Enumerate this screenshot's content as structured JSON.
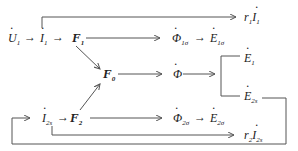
{
  "diagram": {
    "nodes": {
      "U1": {
        "base": "U",
        "sub": "1",
        "dot": true
      },
      "I1": {
        "base": "I",
        "sub": "1",
        "dot": true
      },
      "F1": {
        "base": "F",
        "sub": "1",
        "bold": true
      },
      "F0": {
        "base": "F",
        "sub": "0",
        "bold": true
      },
      "F2": {
        "base": "F",
        "sub": "2",
        "bold": true
      },
      "I2s": {
        "base": "I",
        "sub": "2s",
        "dot": true
      },
      "Phi1s": {
        "base": "Φ",
        "sub": "1σ",
        "dot": true
      },
      "E1s": {
        "base": "E",
        "sub": "1σ",
        "dot": true
      },
      "Phi": {
        "base": "Φ",
        "sub": "",
        "dot": true
      },
      "E1": {
        "base": "E",
        "sub": "1",
        "dot": true
      },
      "E2s": {
        "base": "E",
        "sub": "2s",
        "dot": true
      },
      "Phi2s": {
        "base": "Φ",
        "sub": "2σ",
        "dot": true
      },
      "E2sig": {
        "base": "E",
        "sub": "2σ",
        "dot": true
      },
      "r1I1": {
        "coef": "r",
        "coef_sub": "1",
        "base": "I",
        "sub": "1",
        "dot": true
      },
      "r2I2s": {
        "coef": "r",
        "coef_sub": "2",
        "base": "I",
        "sub": "2s",
        "dot": true
      }
    },
    "arrow_glyph": "→",
    "line_color": "#555555",
    "text_color": "#222222"
  }
}
